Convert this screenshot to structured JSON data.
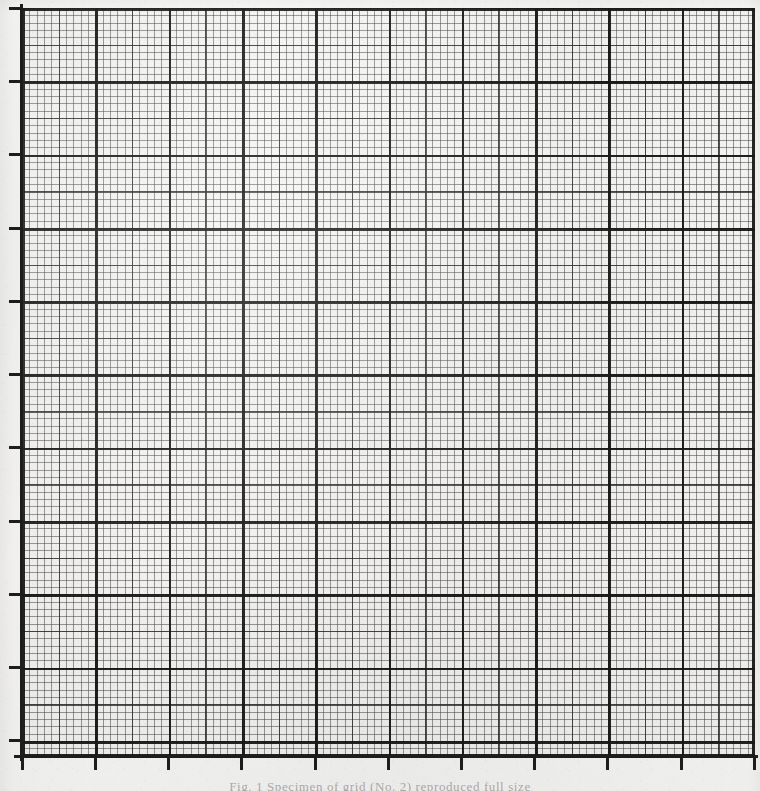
{
  "document": {
    "type": "graph-paper-scan",
    "title": "Blank logarithmic-style ruled graph paper grid"
  },
  "caption": {
    "text": "Fig. 1  Specimen of grid (No. 2) reproduced full size"
  },
  "colors": {
    "paper": "#f4f3f1",
    "fine_rule": "#464646",
    "medium_rule": "#2d2d2d",
    "heavy_rule": "#181818",
    "axis": "#1d1d1d"
  },
  "chart_data": {
    "type": "grid",
    "title": "",
    "subtitle": "",
    "xlabel": "",
    "ylabel": "",
    "series": [],
    "values": [],
    "categories": [],
    "grid": {
      "visible": true,
      "plot_left_px": 22,
      "plot_top_px": 8,
      "plot_width_px": 733,
      "plot_height_px": 749,
      "fine_spacing_px": 7.33,
      "medium_spacing_px": 36.65,
      "heavy_spacing_px": 73.3,
      "fine_per_medium": 5,
      "fine_per_heavy": 10,
      "heavy_columns": 10,
      "heavy_rows": 10,
      "fine_columns": 100,
      "fine_rows": 102
    },
    "axes": {
      "x": {
        "position": "bottom",
        "tick_count": 11,
        "tick_labels": [],
        "range": [
          0,
          10
        ],
        "ticks_inward": false
      },
      "y": {
        "position": "left",
        "tick_count": 11,
        "tick_labels": [],
        "range": [
          0,
          10
        ],
        "ticks_inward": false
      }
    },
    "legend": {
      "visible": false,
      "position": "none",
      "entries": []
    },
    "annotations": []
  },
  "axis_ticks": {
    "left_y_positions": [
      7,
      80,
      153,
      227,
      300,
      373,
      446,
      520,
      593,
      666,
      739
    ],
    "bottom_x_positions": [
      21,
      94,
      167,
      240,
      314,
      387,
      460,
      533,
      606,
      680,
      753
    ]
  }
}
